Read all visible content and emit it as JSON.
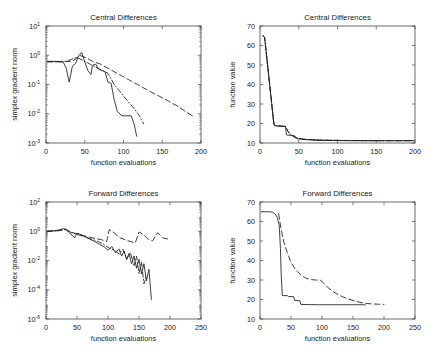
{
  "figure": {
    "background": "#ffffff",
    "line_color": "#1c1c1c",
    "axis_color": "#2b2b2b",
    "layout": "2x2-subplot-grid"
  },
  "chart_data": [
    {
      "id": "top-left",
      "type": "line",
      "title": "Central Differences",
      "xlabel": "function evaluations",
      "ylabel": "simplex gradient norm",
      "xscale": "linear",
      "yscale": "log",
      "xlim": [
        0,
        200
      ],
      "ylim": [
        0.001,
        10
      ],
      "xticks": [
        0,
        50,
        100,
        150,
        200
      ],
      "xticklabels": [
        "0",
        "50",
        "100",
        "150",
        "200"
      ],
      "yticks": [
        10,
        1,
        0.1,
        0.01,
        0.001
      ],
      "yticklabels": [
        "10^1",
        "10^0",
        "10^-1",
        "10^-2",
        "10^-3"
      ],
      "ytick_bases": [
        "10",
        "10",
        "10",
        "10",
        "10"
      ],
      "ytick_exponents": [
        "1",
        "0",
        "-1",
        "-2",
        "-3"
      ],
      "grid": false,
      "legend": "none",
      "series": [
        {
          "name": "solid",
          "style": "solid",
          "x": [
            2,
            12,
            22,
            26,
            30,
            34,
            38,
            42,
            46,
            50,
            54,
            58,
            60,
            64,
            68,
            72,
            76,
            80,
            84,
            88,
            92,
            98,
            104,
            110,
            114,
            117
          ],
          "y": [
            0.62,
            0.62,
            0.6,
            0.36,
            0.12,
            0.42,
            0.52,
            0.95,
            1.25,
            0.6,
            0.3,
            0.22,
            0.45,
            0.5,
            0.33,
            0.3,
            0.28,
            0.12,
            0.11,
            0.03,
            0.012,
            0.0085,
            0.0085,
            0.0085,
            0.0042,
            0.0017
          ]
        },
        {
          "name": "dashed",
          "style": "dashed",
          "x": [
            2,
            20,
            34,
            44,
            52,
            60,
            70,
            80,
            92,
            104,
            118,
            132,
            146,
            158,
            170,
            182,
            190
          ],
          "y": [
            0.6,
            0.6,
            0.62,
            0.98,
            0.82,
            0.62,
            0.5,
            0.36,
            0.24,
            0.16,
            0.1,
            0.062,
            0.04,
            0.027,
            0.018,
            0.011,
            0.0082
          ]
        },
        {
          "name": "dashdot",
          "style": "dashdot",
          "x": [
            2,
            24,
            40,
            52,
            62,
            72,
            80,
            88,
            96,
            104,
            112,
            120,
            126
          ],
          "y": [
            0.6,
            0.6,
            0.85,
            0.58,
            0.42,
            0.31,
            0.24,
            0.1,
            0.055,
            0.03,
            0.017,
            0.009,
            0.0045
          ]
        }
      ]
    },
    {
      "id": "top-right",
      "type": "line",
      "title": "Central Differences",
      "xlabel": "function evaluations",
      "ylabel": "function value",
      "xscale": "linear",
      "yscale": "linear",
      "xlim": [
        0,
        200
      ],
      "ylim": [
        10,
        70
      ],
      "xticks": [
        0,
        50,
        100,
        150,
        200
      ],
      "xticklabels": [
        "0",
        "50",
        "100",
        "150",
        "200"
      ],
      "yticks": [
        10,
        20,
        30,
        40,
        50,
        60,
        70
      ],
      "yticklabels": [
        "10",
        "20",
        "30",
        "40",
        "50",
        "60",
        "70"
      ],
      "grid": false,
      "legend": "none",
      "series": [
        {
          "name": "solid",
          "style": "solid",
          "x": [
            4,
            6,
            18,
            20,
            33,
            34,
            36,
            44,
            48,
            56,
            64,
            72,
            84,
            100,
            120,
            140,
            160,
            180,
            198
          ],
          "y": [
            65,
            64,
            19.5,
            18.8,
            18.5,
            14.2,
            14.0,
            13.9,
            12.2,
            11.8,
            11.6,
            11.4,
            11.3,
            11.25,
            11.2,
            11.2,
            11.2,
            11.2,
            11.2
          ]
        },
        {
          "name": "dashed",
          "style": "dashed",
          "x": [
            4,
            6,
            18,
            20,
            33,
            36,
            42,
            48,
            56,
            66,
            80,
            96,
            116,
            140,
            164,
            186,
            198
          ],
          "y": [
            65,
            64,
            19.4,
            18.9,
            18.5,
            16.0,
            13.6,
            12.6,
            12.0,
            11.7,
            11.5,
            11.35,
            11.25,
            11.2,
            11.2,
            11.2,
            11.2
          ]
        },
        {
          "name": "dashdot",
          "style": "dashdot",
          "x": [
            4,
            6,
            18,
            20,
            33,
            38,
            46,
            56,
            70,
            90,
            112,
            140,
            168,
            198
          ],
          "y": [
            65,
            64,
            19.4,
            18.8,
            18.4,
            14.5,
            12.6,
            11.9,
            11.6,
            11.4,
            11.3,
            11.22,
            11.2,
            11.2
          ]
        }
      ]
    },
    {
      "id": "bottom-left",
      "type": "line",
      "title": "Forward Differences",
      "xlabel": "function evaluations",
      "ylabel": "simplex gradient norm",
      "xscale": "linear",
      "yscale": "log",
      "xlim": [
        0,
        250
      ],
      "ylim": [
        1e-06,
        100
      ],
      "xticks": [
        0,
        50,
        100,
        150,
        200,
        250
      ],
      "xticklabels": [
        "0",
        "50",
        "100",
        "150",
        "200",
        "250"
      ],
      "yticks": [
        100,
        1,
        0.01,
        0.0001,
        1e-06
      ],
      "yticklabels": [
        "10^2",
        "10^0",
        "10^-2",
        "10^-4",
        "10^-6"
      ],
      "ytick_bases": [
        "10",
        "10",
        "10",
        "10",
        "10"
      ],
      "ytick_exponents": [
        "2",
        "0",
        "-2",
        "-4",
        "-6"
      ],
      "grid": false,
      "legend": "none",
      "series": [
        {
          "name": "solid",
          "style": "solid",
          "x": [
            2,
            10,
            20,
            28,
            32,
            36,
            42,
            46,
            50,
            56,
            62,
            70,
            78,
            86,
            94,
            100,
            106,
            112,
            118,
            122,
            126,
            130,
            134,
            138,
            142,
            146,
            150,
            154,
            158,
            162,
            166,
            170
          ],
          "y": [
            1.0,
            1.05,
            1.2,
            1.5,
            1.4,
            0.9,
            0.55,
            0.35,
            0.75,
            0.6,
            0.45,
            0.3,
            0.2,
            0.13,
            0.085,
            0.05,
            0.09,
            0.035,
            0.06,
            0.02,
            0.045,
            0.012,
            0.03,
            0.006,
            0.02,
            0.003,
            0.012,
            0.0012,
            0.006,
            0.0004,
            0.0025,
            2.2e-05
          ]
        },
        {
          "name": "dashed",
          "style": "dashed",
          "x": [
            2,
            20,
            32,
            40,
            46,
            52,
            60,
            70,
            80,
            90,
            98,
            102,
            108,
            114,
            120,
            128,
            136,
            144,
            150,
            158,
            164,
            172,
            180,
            188,
            196
          ],
          "y": [
            1.0,
            1.1,
            1.35,
            0.9,
            0.75,
            0.62,
            0.5,
            0.4,
            0.32,
            0.26,
            0.2,
            1.3,
            0.9,
            0.55,
            0.35,
            0.26,
            0.2,
            0.16,
            0.9,
            0.55,
            0.3,
            0.22,
            0.8,
            0.35,
            0.3
          ]
        },
        {
          "name": "dashdot",
          "style": "dashdot",
          "x": [
            2,
            18,
            30,
            40,
            50,
            60,
            72,
            84,
            94,
            102,
            110,
            118,
            124,
            130,
            136,
            142,
            146,
            150,
            154,
            158,
            162
          ],
          "y": [
            1.0,
            1.05,
            1.3,
            0.85,
            0.62,
            0.45,
            0.3,
            0.2,
            0.12,
            0.07,
            0.05,
            0.028,
            0.06,
            0.012,
            0.035,
            0.0045,
            0.02,
            0.0012,
            0.008,
            0.00025,
            0.0009
          ]
        }
      ]
    },
    {
      "id": "bottom-right",
      "type": "line",
      "title": "Forward Differences",
      "xlabel": "function evaluations",
      "ylabel": "function value",
      "xscale": "linear",
      "yscale": "linear",
      "xlim": [
        0,
        250
      ],
      "ylim": [
        10,
        70
      ],
      "xticks": [
        0,
        50,
        100,
        150,
        200,
        250
      ],
      "xticklabels": [
        "0",
        "50",
        "100",
        "150",
        "200",
        "250"
      ],
      "yticks": [
        10,
        20,
        30,
        40,
        50,
        60,
        70
      ],
      "yticklabels": [
        "10",
        "20",
        "30",
        "40",
        "50",
        "60",
        "70"
      ],
      "grid": false,
      "legend": "none",
      "series": [
        {
          "name": "solid",
          "style": "solid",
          "x": [
            2,
            14,
            20,
            24,
            28,
            31,
            33,
            34,
            36,
            44,
            46,
            54,
            56,
            64,
            66,
            76,
            96,
            120,
            150,
            166,
            170
          ],
          "y": [
            65,
            65,
            64.8,
            64,
            62,
            58,
            46,
            34,
            22,
            22,
            21.5,
            21.5,
            19.5,
            19.4,
            17.5,
            17.4,
            17.3,
            17.3,
            17.3,
            17.3,
            17.2
          ]
        },
        {
          "name": "dashed",
          "style": "dashed",
          "x": [
            30,
            34,
            38,
            44,
            50,
            58,
            66,
            74,
            82,
            90,
            98,
            104,
            110,
            118,
            126,
            134,
            142,
            150,
            158,
            166,
            174,
            182,
            190,
            200
          ],
          "y": [
            64,
            56,
            50,
            44,
            39,
            35,
            32.5,
            31,
            30.2,
            30,
            29.8,
            28,
            26,
            24,
            22.5,
            21.3,
            20.3,
            19.5,
            18.8,
            18.2,
            17.9,
            17.7,
            17.6,
            17.5
          ]
        }
      ]
    }
  ]
}
